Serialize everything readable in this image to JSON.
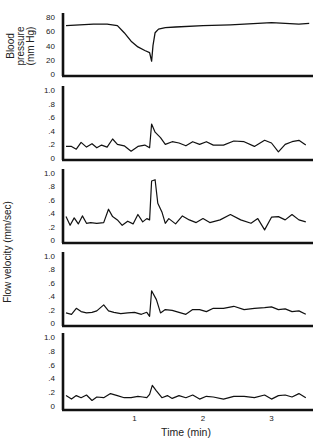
{
  "chart_data": {
    "type": "line",
    "title": "",
    "xlabel": "Time (min)",
    "x_ticks": [
      "1",
      "2",
      "3"
    ],
    "x_range": [
      0,
      3.6
    ],
    "panels": [
      {
        "name": "blood-pressure",
        "ylabel_lines": [
          "Blood",
          "pressure",
          "(mm Hg)"
        ],
        "y_ticks": [
          "80",
          "60",
          "40",
          "20",
          "0"
        ],
        "ylim": [
          0,
          80
        ],
        "x": [
          0.0,
          0.2,
          0.4,
          0.6,
          0.75,
          0.85,
          0.95,
          1.05,
          1.15,
          1.22,
          1.25,
          1.27,
          1.3,
          1.35,
          1.45,
          1.6,
          2.0,
          2.4,
          2.8,
          3.0,
          3.2,
          3.4,
          3.55
        ],
        "values": [
          68,
          69,
          70,
          70,
          68,
          58,
          46,
          38,
          33,
          30,
          18,
          40,
          58,
          63,
          65,
          66,
          68,
          69,
          71,
          72,
          71,
          70,
          71
        ]
      },
      {
        "name": "flow-velocity-1",
        "y_ticks": [
          "1.0",
          ".8",
          ".6",
          ".4",
          ".2",
          "0"
        ],
        "ylim": [
          0,
          1.0
        ],
        "x": [
          0.0,
          0.08,
          0.15,
          0.22,
          0.3,
          0.38,
          0.45,
          0.52,
          0.6,
          0.68,
          0.75,
          0.85,
          0.95,
          1.05,
          1.15,
          1.22,
          1.25,
          1.3,
          1.38,
          1.45,
          1.55,
          1.65,
          1.75,
          1.85,
          1.95,
          2.05,
          2.15,
          2.3,
          2.45,
          2.6,
          2.75,
          2.9,
          3.0,
          3.1,
          3.2,
          3.3,
          3.4,
          3.5
        ],
        "values": [
          0.17,
          0.17,
          0.13,
          0.23,
          0.16,
          0.21,
          0.15,
          0.19,
          0.16,
          0.28,
          0.2,
          0.18,
          0.1,
          0.17,
          0.19,
          0.15,
          0.5,
          0.38,
          0.3,
          0.2,
          0.24,
          0.22,
          0.18,
          0.24,
          0.2,
          0.24,
          0.19,
          0.19,
          0.25,
          0.24,
          0.17,
          0.26,
          0.22,
          0.09,
          0.2,
          0.24,
          0.26,
          0.19
        ]
      },
      {
        "name": "flow-velocity-2",
        "ylabel": "Flow velocity (mm/sec)",
        "y_ticks": [
          "1.0",
          ".8",
          ".6",
          ".4",
          ".2",
          "0"
        ],
        "ylim": [
          0,
          1.0
        ],
        "x": [
          0.0,
          0.06,
          0.12,
          0.18,
          0.24,
          0.3,
          0.36,
          0.45,
          0.55,
          0.62,
          0.68,
          0.75,
          0.82,
          0.9,
          0.98,
          1.05,
          1.12,
          1.18,
          1.22,
          1.25,
          1.3,
          1.34,
          1.4,
          1.45,
          1.5,
          1.6,
          1.7,
          1.8,
          1.9,
          2.0,
          2.1,
          2.25,
          2.4,
          2.55,
          2.7,
          2.8,
          2.9,
          3.0,
          3.1,
          3.2,
          3.3,
          3.4,
          3.5
        ],
        "values": [
          0.35,
          0.22,
          0.33,
          0.24,
          0.36,
          0.25,
          0.26,
          0.25,
          0.26,
          0.46,
          0.35,
          0.3,
          0.22,
          0.28,
          0.24,
          0.38,
          0.27,
          0.32,
          0.3,
          0.88,
          0.9,
          0.55,
          0.42,
          0.25,
          0.32,
          0.24,
          0.36,
          0.3,
          0.26,
          0.32,
          0.26,
          0.3,
          0.38,
          0.3,
          0.25,
          0.32,
          0.15,
          0.34,
          0.35,
          0.3,
          0.38,
          0.3,
          0.27
        ]
      },
      {
        "name": "flow-velocity-3",
        "y_ticks": [
          "1.0",
          ".8",
          ".6",
          ".4",
          ".2",
          "0"
        ],
        "ylim": [
          0,
          1.0
        ],
        "x": [
          0.0,
          0.08,
          0.15,
          0.22,
          0.3,
          0.38,
          0.45,
          0.55,
          0.62,
          0.7,
          0.8,
          0.9,
          1.0,
          1.1,
          1.18,
          1.22,
          1.25,
          1.32,
          1.38,
          1.45,
          1.55,
          1.65,
          1.75,
          1.85,
          1.95,
          2.05,
          2.15,
          2.3,
          2.45,
          2.6,
          2.75,
          2.9,
          3.0,
          3.1,
          3.2,
          3.3,
          3.4,
          3.5
        ],
        "values": [
          0.15,
          0.13,
          0.22,
          0.17,
          0.15,
          0.16,
          0.18,
          0.27,
          0.18,
          0.16,
          0.14,
          0.15,
          0.16,
          0.13,
          0.16,
          0.1,
          0.48,
          0.35,
          0.15,
          0.2,
          0.19,
          0.16,
          0.13,
          0.2,
          0.2,
          0.17,
          0.22,
          0.22,
          0.25,
          0.2,
          0.22,
          0.23,
          0.24,
          0.2,
          0.21,
          0.17,
          0.18,
          0.13
        ]
      },
      {
        "name": "flow-velocity-4",
        "y_ticks": [
          "1.0",
          ".8",
          ".6",
          ".4",
          ".2",
          "0"
        ],
        "ylim": [
          0,
          1.0
        ],
        "x": [
          0.0,
          0.08,
          0.15,
          0.22,
          0.3,
          0.38,
          0.45,
          0.55,
          0.65,
          0.75,
          0.85,
          0.95,
          1.05,
          1.12,
          1.18,
          1.22,
          1.26,
          1.32,
          1.4,
          1.48,
          1.55,
          1.65,
          1.75,
          1.85,
          1.95,
          2.05,
          2.15,
          2.3,
          2.45,
          2.6,
          2.75,
          2.9,
          3.0,
          3.1,
          3.2,
          3.3,
          3.4,
          3.5
        ],
        "values": [
          0.15,
          0.1,
          0.15,
          0.12,
          0.16,
          0.08,
          0.13,
          0.12,
          0.18,
          0.15,
          0.12,
          0.12,
          0.14,
          0.13,
          0.12,
          0.17,
          0.3,
          0.22,
          0.12,
          0.15,
          0.11,
          0.15,
          0.12,
          0.16,
          0.1,
          0.14,
          0.13,
          0.1,
          0.14,
          0.14,
          0.12,
          0.16,
          0.1,
          0.15,
          0.16,
          0.13,
          0.18,
          0.12
        ]
      }
    ],
    "grid": false,
    "legend": null
  }
}
